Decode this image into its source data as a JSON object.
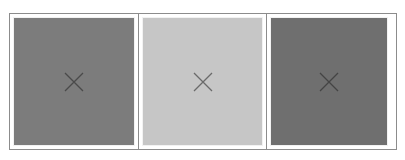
{
  "gallery": {
    "items": [
      {
        "state": "image-missing",
        "fill_color": "#7c7c7c",
        "icon": "broken-image-x-icon",
        "icon_color": "#4a4a4a"
      },
      {
        "state": "image-missing",
        "fill_color": "#c6c6c6",
        "icon": "broken-image-x-icon",
        "icon_color": "#6a6a6a"
      },
      {
        "state": "image-missing",
        "fill_color": "#6f6f6f",
        "icon": "broken-image-x-icon",
        "icon_color": "#444444"
      }
    ],
    "border_color": "#8c8c8c"
  }
}
